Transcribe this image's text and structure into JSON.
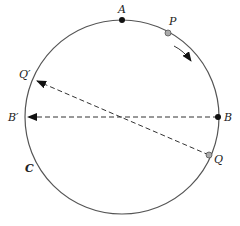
{
  "diagram": {
    "type": "circle-points-projection",
    "circle": {
      "label": "C",
      "cx": 122,
      "cy": 117,
      "r": 97,
      "stroke": "#555555"
    },
    "points": [
      {
        "id": "A",
        "label": "A",
        "x": 122,
        "y": 20,
        "fill": "#111111",
        "label_x": 119,
        "label_y": 13
      },
      {
        "id": "P",
        "label": "P",
        "x": 168,
        "y": 33,
        "fill": "#aaaaaa",
        "label_x": 169,
        "label_y": 24
      },
      {
        "id": "B",
        "label": "B",
        "x": 218,
        "y": 117,
        "fill": "#111111",
        "label_x": 224,
        "label_y": 121
      },
      {
        "id": "Q",
        "label": "Q",
        "x": 209,
        "y": 155,
        "fill": "#aaaaaa",
        "label_x": 214,
        "label_y": 163
      },
      {
        "id": "Bprime",
        "label": "B′",
        "x": 26,
        "y": 117,
        "label_x": 8,
        "label_y": 121
      },
      {
        "id": "Qprime",
        "label": "Q′",
        "x": 35,
        "y": 80,
        "label_x": 20,
        "label_y": 76
      }
    ],
    "labels": {
      "C": "C",
      "A": "A",
      "P": "P",
      "B": "B",
      "Q": "Q",
      "Bprime": "B′",
      "Qprime": "Q′"
    },
    "arrows": [
      {
        "from": "B",
        "to": "Bprime",
        "style": "dashed"
      },
      {
        "from": "Q",
        "to": "Qprime",
        "style": "dashed"
      }
    ],
    "rotation_arrow": {
      "direction": "clockwise",
      "near": "P"
    }
  }
}
